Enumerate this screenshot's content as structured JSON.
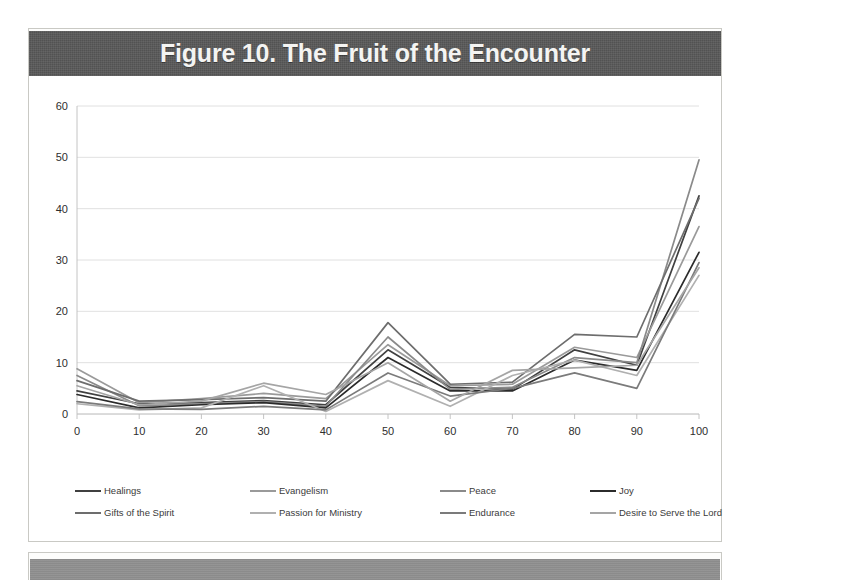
{
  "figure": {
    "title": "Figure 10. The Fruit of the Encounter",
    "title_bar_color": "#575757"
  },
  "legend": {
    "rows": [
      [
        {
          "label": "Healings",
          "color": "#404040"
        },
        {
          "label": "Evangelism",
          "color": "#9a9a9a"
        },
        {
          "label": "Peace",
          "color": "#8a8a8a"
        },
        {
          "label": "Joy",
          "color": "#2b2b2b"
        }
      ],
      [
        {
          "label": "Gifts of the Spirit",
          "color": "#6d6d6d"
        },
        {
          "label": "Passion for Ministry",
          "color": "#b0b0b0"
        },
        {
          "label": "Endurance",
          "color": "#7b7b7b"
        },
        {
          "label": "Desire to Serve the Lord",
          "color": "#a5a5a5"
        }
      ]
    ]
  },
  "chart_data": {
    "type": "line",
    "title": "Figure 10. The Fruit of the Encounter",
    "xlabel": "",
    "ylabel": "",
    "x": [
      0,
      10,
      20,
      30,
      40,
      50,
      60,
      70,
      80,
      90,
      100
    ],
    "xlim": [
      0,
      100
    ],
    "ylim": [
      0,
      60
    ],
    "yticks": [
      0,
      10,
      20,
      30,
      40,
      50,
      60
    ],
    "xticks": [
      0,
      10,
      20,
      30,
      40,
      50,
      60,
      70,
      80,
      90,
      100
    ],
    "grid": true,
    "legend_position": "bottom",
    "series": [
      {
        "name": "Healings",
        "color": "#404040",
        "values": [
          4.5,
          2.0,
          2.2,
          2.6,
          1.8,
          12.5,
          5.2,
          4.8,
          12.5,
          9.5,
          42.5
        ]
      },
      {
        "name": "Evangelism",
        "color": "#9a9a9a",
        "values": [
          8.8,
          2.2,
          3.0,
          4.0,
          3.0,
          13.5,
          5.5,
          5.8,
          13.0,
          11.0,
          36.5
        ]
      },
      {
        "name": "Peace",
        "color": "#8a8a8a",
        "values": [
          7.5,
          1.6,
          2.0,
          2.4,
          1.5,
          15.0,
          4.8,
          5.2,
          11.0,
          10.0,
          49.5
        ]
      },
      {
        "name": "Joy",
        "color": "#2b2b2b",
        "values": [
          3.8,
          1.2,
          1.8,
          2.2,
          1.2,
          11.0,
          4.5,
          4.5,
          10.5,
          8.5,
          31.5
        ]
      },
      {
        "name": "Gifts of the Spirit",
        "color": "#6d6d6d",
        "values": [
          6.5,
          2.5,
          2.8,
          3.2,
          2.5,
          17.8,
          5.8,
          6.2,
          15.5,
          15.0,
          42.0
        ]
      },
      {
        "name": "Passion for Ministry",
        "color": "#b0b0b0",
        "values": [
          2.0,
          0.8,
          1.2,
          5.5,
          0.5,
          6.5,
          1.5,
          7.5,
          10.5,
          7.5,
          27.0
        ]
      },
      {
        "name": "Endurance",
        "color": "#7b7b7b",
        "values": [
          2.4,
          1.0,
          0.9,
          1.5,
          0.8,
          8.0,
          3.5,
          5.0,
          8.0,
          5.0,
          29.5
        ]
      },
      {
        "name": "Desire to Serve the Lord",
        "color": "#a5a5a5",
        "values": [
          5.5,
          1.8,
          2.5,
          6.0,
          3.8,
          10.0,
          2.5,
          8.5,
          9.0,
          9.5,
          28.5
        ]
      }
    ]
  }
}
